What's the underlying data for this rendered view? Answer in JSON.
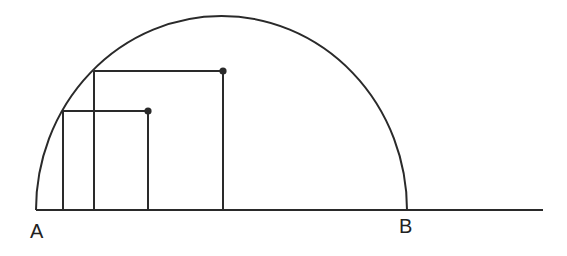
{
  "diagram": {
    "type": "geometry",
    "colors": {
      "stroke": "#2a2a2a",
      "background": "#ffffff"
    },
    "labels": {
      "a": "A",
      "b": "B"
    },
    "baseline": {
      "x1": 36,
      "x2": 543,
      "y": 210
    },
    "arc": {
      "cx": 221.5,
      "cy": 210,
      "rx": 185.5,
      "ry": 194
    },
    "rectangles": [
      {
        "name": "small",
        "x_left": 63,
        "x_right": 148,
        "y_top": 111,
        "point": [
          148,
          111
        ]
      },
      {
        "name": "large",
        "x_left": 94,
        "x_right": 223,
        "y_top": 71,
        "point": [
          223,
          71
        ]
      }
    ]
  }
}
